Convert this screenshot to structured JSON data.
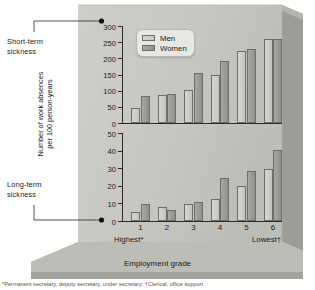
{
  "annotations": {
    "short_term": "Short-term\nsickness",
    "long_term": "Long-term\nsickness"
  },
  "axis": {
    "ylabel": "Number of work absences\nper 100 person-years",
    "xlabel": "Employment grade",
    "highest": "Highest*",
    "lowest": "Lowest†"
  },
  "legend": {
    "men": "Men",
    "women": "Women"
  },
  "footnote": "*Permanent secretary, deputy secretary, under secretary; †Clerical, office support",
  "colors": {
    "men_bar": "#cdcdc8",
    "women_bar": "#9a9a97",
    "panel": "#c9c9c4",
    "panel_dark": "#a8a8a3",
    "base": "#b9b9b4",
    "axis": "#2a2a2a",
    "legend_bg": "#e7e7e3"
  },
  "chart_data": [
    {
      "type": "bar",
      "title": "Short-term sickness",
      "categories": [
        "1",
        "2",
        "3",
        "4",
        "5",
        "6"
      ],
      "series": [
        {
          "name": "Men",
          "values": [
            48,
            88,
            104,
            151,
            226,
            261
          ]
        },
        {
          "name": "Women",
          "values": [
            85,
            91,
            157,
            194,
            232,
            264
          ]
        }
      ],
      "xlabel": "Employment grade",
      "ylabel": "Number of work absences per 100 person-years",
      "ylim": [
        0,
        300
      ],
      "yticks": [
        0,
        50,
        100,
        150,
        200,
        250,
        300
      ],
      "grid": false,
      "legend_position": "top-left"
    },
    {
      "type": "bar",
      "title": "Long-term sickness",
      "categories": [
        "1",
        "2",
        "3",
        "4",
        "5",
        "6"
      ],
      "series": [
        {
          "name": "Men",
          "values": [
            5,
            8,
            10,
            12.5,
            20,
            30
          ]
        },
        {
          "name": "Women",
          "values": [
            10,
            6.5,
            11,
            25,
            29,
            41
          ]
        }
      ],
      "xlabel": "Employment grade",
      "ylabel": "Number of work absences per 100 person-years",
      "ylim": [
        0,
        50
      ],
      "yticks": [
        0,
        10,
        20,
        30,
        40,
        50
      ],
      "grid": false,
      "legend_position": "none"
    }
  ]
}
